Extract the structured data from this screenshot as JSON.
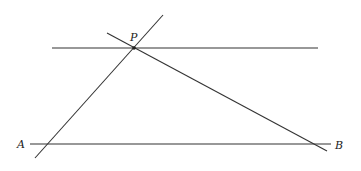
{
  "diagram": {
    "labels": {
      "A": "A",
      "B": "B",
      "P": "P"
    },
    "line_color": "#333333",
    "lines": [
      {
        "name": "parallel-through-P",
        "x1": 52,
        "y1": 48,
        "x2": 318,
        "y2": 48
      },
      {
        "name": "line-AB",
        "x1": 30,
        "y1": 144,
        "x2": 331,
        "y2": 144
      },
      {
        "name": "line-A-through-P",
        "x1": 35,
        "y1": 158,
        "x2": 163,
        "y2": 15
      },
      {
        "name": "line-P-to-B",
        "x1": 107,
        "y1": 33,
        "x2": 327,
        "y2": 151
      }
    ],
    "points": [
      {
        "name": "P",
        "x": 134,
        "y": 48
      }
    ]
  }
}
